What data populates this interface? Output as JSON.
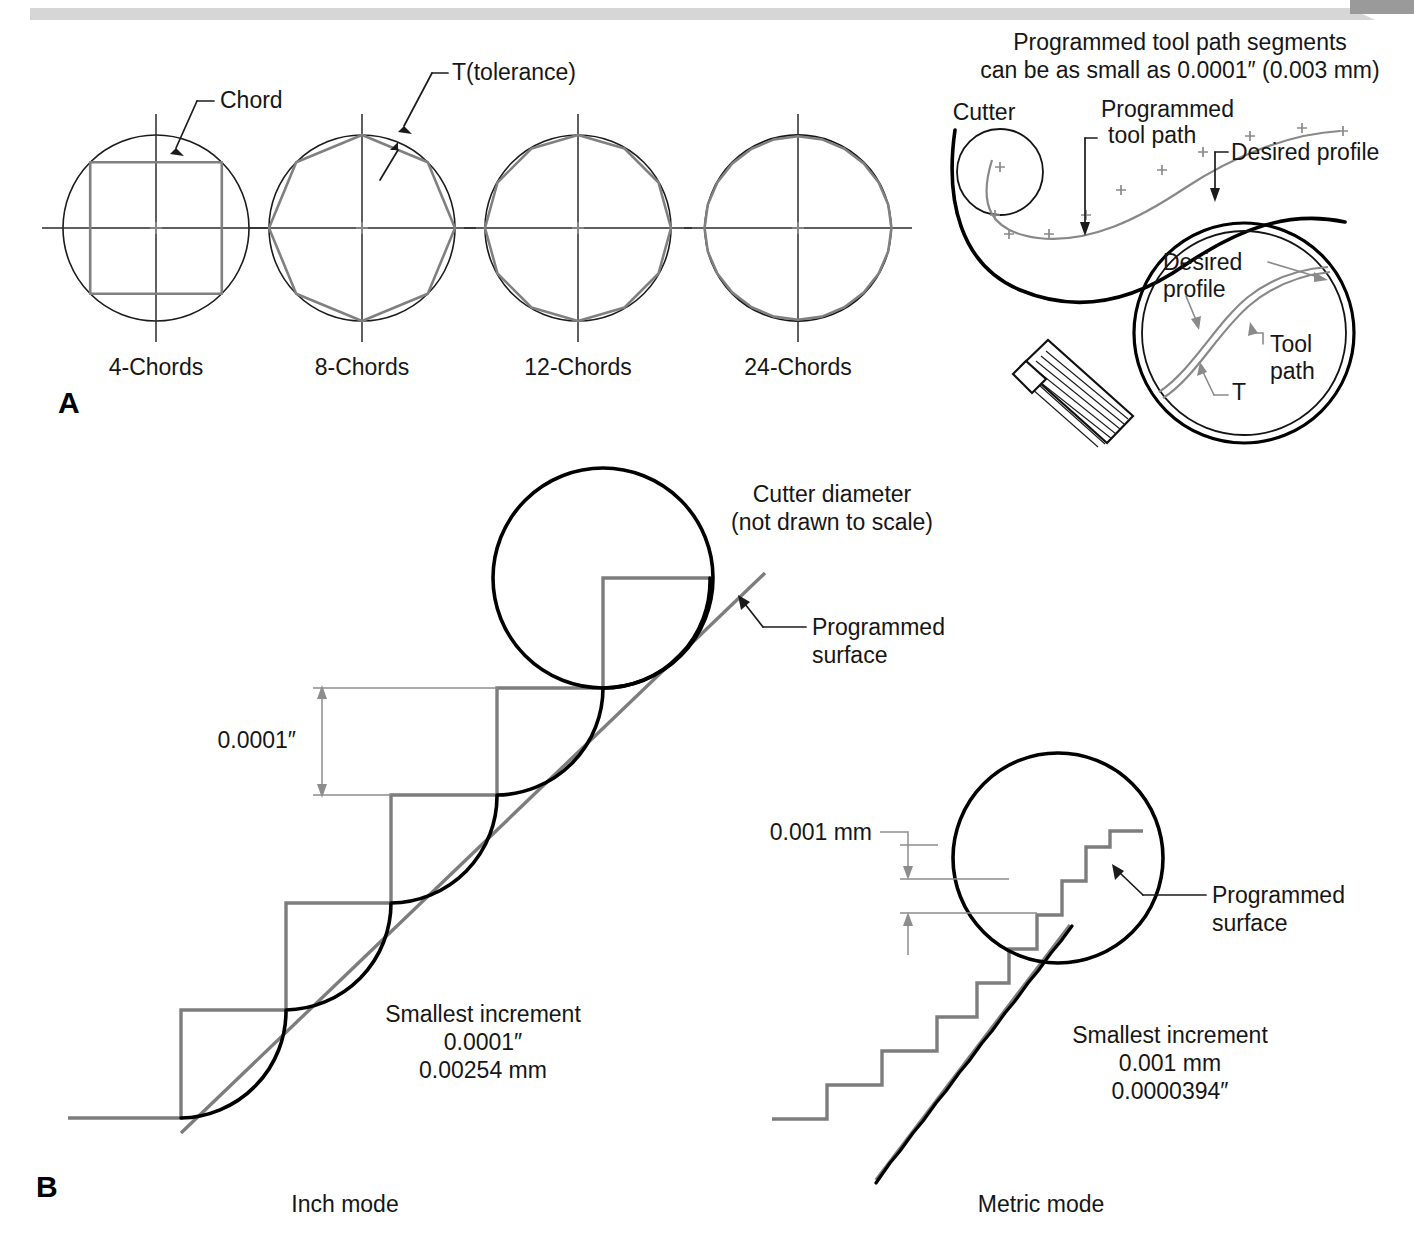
{
  "figure": {
    "panel_a_letter": "A",
    "panel_b_letter": "B"
  },
  "panel_a": {
    "chords": {
      "callout_chord": "Chord",
      "callout_tolerance": "T(tolerance)",
      "captions": [
        "4-Chords",
        "8-Chords",
        "12-Chords",
        "24-Chords"
      ],
      "chord_counts": [
        4,
        8,
        12,
        24
      ]
    },
    "toolpath": {
      "heading_line1": "Programmed tool path segments",
      "heading_line2": "can be as small as 0.0001″ (0.003 mm)",
      "label_cutter": "Cutter",
      "label_programmed_line1": "Programmed",
      "label_programmed_line2": "tool path",
      "label_desired_profile": "Desired profile",
      "magnifier_desired_line1": "Desired",
      "magnifier_desired_line2": "profile",
      "magnifier_tool_line1": "Tool",
      "magnifier_tool_line2": "path",
      "magnifier_tolerance": "T"
    }
  },
  "panel_b": {
    "inch": {
      "mode_caption": "Inch mode",
      "cutter_label_line1": "Cutter diameter",
      "cutter_label_line2": "(not drawn to scale)",
      "surface_label_line1": "Programmed",
      "surface_label_line2": "surface",
      "step_dimension": "0.0001″",
      "increment_title": "Smallest increment",
      "increment_value1": "0.0001″",
      "increment_value2": "0.00254 mm"
    },
    "metric": {
      "mode_caption": "Metric mode",
      "surface_label_line1": "Programmed",
      "surface_label_line2": "surface",
      "step_dimension": "0.001 mm",
      "increment_title": "Smallest increment",
      "increment_value1": "0.001 mm",
      "increment_value2": "0.0000394″"
    }
  },
  "colors": {
    "line_dark": "#000000",
    "line_gray": "#7d7d7d",
    "text": "#161616",
    "background": "#ffffff"
  }
}
